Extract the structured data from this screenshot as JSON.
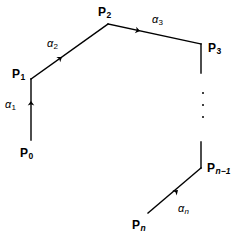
{
  "figure": {
    "kind": "directed-polygonal-path-diagram",
    "background_color": "#ffffff",
    "stroke_color": "#000000",
    "width": 246,
    "height": 242
  },
  "vertices": [
    {
      "id": "P0",
      "base": "P",
      "sub": "0",
      "sub_italic": false,
      "label_x": 20,
      "label_y": 147
    },
    {
      "id": "P1",
      "base": "P",
      "sub": "1",
      "sub_italic": false,
      "label_x": 12,
      "label_y": 68
    },
    {
      "id": "P2",
      "base": "P",
      "sub": "2",
      "sub_italic": false,
      "label_x": 98,
      "label_y": 6
    },
    {
      "id": "P3",
      "base": "P",
      "sub": "3",
      "sub_italic": false,
      "label_x": 208,
      "label_y": 42
    },
    {
      "id": "Pn-1",
      "base": "P",
      "sub": "n−1",
      "sub_italic": true,
      "label_x": 207,
      "label_y": 162
    },
    {
      "id": "Pn",
      "base": "P",
      "sub": "n",
      "sub_italic": true,
      "label_x": 132,
      "label_y": 219
    }
  ],
  "edges": [
    {
      "id": "alpha1",
      "base": "α",
      "sub": "1",
      "sub_italic": false,
      "label_x": 5,
      "label_y": 99,
      "from": "P0",
      "to": "P1"
    },
    {
      "id": "alpha2",
      "base": "α",
      "sub": "2",
      "sub_italic": false,
      "label_x": 47,
      "label_y": 38,
      "from": "P1",
      "to": "P2"
    },
    {
      "id": "alpha3",
      "base": "α",
      "sub": "3",
      "sub_italic": false,
      "label_x": 152,
      "label_y": 14,
      "from": "P2",
      "to": "P3"
    },
    {
      "id": "alphan",
      "base": "α",
      "sub": "n",
      "sub_italic": true,
      "label_x": 178,
      "label_y": 203,
      "from": "Pn",
      "to": "Pn-1"
    }
  ],
  "continuation": {
    "name": "vertical-ellipsis",
    "dot_count": 3,
    "x": 202,
    "y": 92,
    "height": 26
  },
  "geometry": {
    "segment_p0_p1": {
      "x1": 31,
      "y1": 140,
      "x2": 31,
      "y2": 79
    },
    "segment_p1_p2": {
      "x1": 31,
      "y1": 79,
      "x2": 108,
      "y2": 24
    },
    "segment_p2_p3": {
      "x1": 108,
      "y1": 24,
      "x2": 201,
      "y2": 44
    },
    "stub_below_p3": {
      "x1": 201,
      "y1": 44,
      "x2": 201,
      "y2": 73
    },
    "stub_above_pn_1": {
      "x1": 201,
      "y1": 142,
      "x2": 201,
      "y2": 168
    },
    "segment_pn_pn_1": {
      "x1": 148,
      "y1": 213,
      "x2": 201,
      "y2": 168
    },
    "arrowhead_p0_p1": {
      "x": 31,
      "y": 101,
      "angle_deg": -90
    },
    "arrowhead_p1_p2": {
      "x": 62,
      "y": 57,
      "angle_deg": -35.5
    },
    "arrowhead_p2_p3": {
      "x": 140,
      "y": 31,
      "angle_deg": 12.2
    },
    "arrowhead_pn_pn_1": {
      "x": 178,
      "y": 190,
      "angle_deg": -40.3
    }
  }
}
